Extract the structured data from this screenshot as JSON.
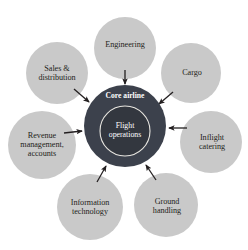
{
  "diagram": {
    "type": "hub-and-spoke",
    "background_color": "#ffffff",
    "canvas": {
      "width": 248,
      "height": 250
    },
    "core": {
      "title": "Core airline",
      "inner_label": "Flight\noperations",
      "outer_circle": {
        "cx": 125,
        "cy": 126,
        "r": 41,
        "fill": "#3c414c"
      },
      "inner_circle": {
        "cx": 125,
        "cy": 131,
        "r": 25,
        "fill": "#33373f",
        "stroke": "#e8e6e0",
        "stroke_width": 1.1
      },
      "title_position": {
        "x": 125,
        "y": 96
      }
    },
    "satellite_fill": "#c9c9c9",
    "arrow_color": "#231f20",
    "nodes": [
      {
        "id": "engineering",
        "label": "Engineering",
        "cx": 125,
        "cy": 48,
        "r": 31,
        "label_x": 125,
        "label_y": 45,
        "arrow": {
          "x1": 125,
          "y1": 70,
          "x2": 125,
          "y2": 84
        }
      },
      {
        "id": "cargo",
        "label": "Cargo",
        "cx": 191,
        "cy": 73,
        "r": 30,
        "label_x": 192,
        "label_y": 73,
        "arrow": {
          "x1": 173,
          "y1": 92,
          "x2": 159,
          "y2": 104
        }
      },
      {
        "id": "inflight-catering",
        "label": "Inflight\ncatering",
        "cx": 211,
        "cy": 142,
        "r": 31,
        "label_x": 212,
        "label_y": 142,
        "arrow": {
          "x1": 187,
          "y1": 128,
          "x2": 169,
          "y2": 128
        }
      },
      {
        "id": "ground-handling",
        "label": "Ground\nhandling",
        "cx": 166,
        "cy": 205,
        "r": 32,
        "label_x": 167,
        "label_y": 206,
        "arrow": {
          "x1": 156,
          "y1": 180,
          "x2": 146,
          "y2": 165
        }
      },
      {
        "id": "information-technology",
        "label": "Information\ntechnology",
        "cx": 90,
        "cy": 207,
        "r": 33,
        "label_x": 90,
        "label_y": 207,
        "arrow": {
          "x1": 97,
          "y1": 182,
          "x2": 106,
          "y2": 166
        }
      },
      {
        "id": "revenue-management-accounts",
        "label": "Revenue\nmanagement,\naccounts",
        "cx": 42,
        "cy": 145,
        "r": 34,
        "label_x": 42,
        "label_y": 145,
        "arrow": {
          "x1": 64,
          "y1": 133,
          "x2": 82,
          "y2": 131
        }
      },
      {
        "id": "sales-distribution",
        "label": "Sales &\ndistribution",
        "cx": 57,
        "cy": 73,
        "r": 31,
        "label_x": 57,
        "label_y": 73,
        "arrow": {
          "x1": 74,
          "y1": 89,
          "x2": 89,
          "y2": 102
        }
      }
    ]
  }
}
